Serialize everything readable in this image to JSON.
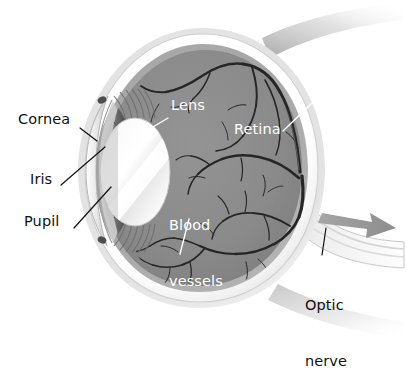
{
  "diagram": {
    "type": "anatomical-cross-section",
    "view": "sagittal cross-section, anterior at left, posterior at right"
  },
  "labels": {
    "cornea": {
      "text": "Cornea",
      "color": "#111111",
      "x": 18,
      "y": 118,
      "leader": {
        "x1": 80,
        "y1": 128,
        "x2": 97,
        "y2": 141,
        "color": "#111111"
      }
    },
    "iris": {
      "text": "Iris",
      "color": "#111111",
      "x": 30,
      "y": 178,
      "leader": {
        "x1": 61,
        "y1": 185,
        "x2": 105,
        "y2": 147,
        "color": "#111111"
      }
    },
    "pupil": {
      "text": "Pupil",
      "color": "#111111",
      "x": 24,
      "y": 220,
      "leader": {
        "x1": 74,
        "y1": 228,
        "x2": 111,
        "y2": 187,
        "color": "#111111"
      }
    },
    "lens": {
      "text": "Lens",
      "color": "#ffffff",
      "x": 171,
      "y": 104,
      "leader": {
        "x1": 168,
        "y1": 118,
        "x2": 148,
        "y2": 130,
        "color": "#ffffff"
      }
    },
    "retina": {
      "text": "Retina",
      "color": "#ffffff",
      "x": 234,
      "y": 128,
      "leader": {
        "x1": 312,
        "y1": 103,
        "x2": 283,
        "y2": 131,
        "color": "#ffffff"
      }
    },
    "blood_vessels": {
      "text": "Blood\nvessels",
      "line1": "Blood",
      "line2": "vessels",
      "color": "#ffffff",
      "x": 169,
      "y": 185,
      "leader": {
        "x1": 189,
        "y1": 219,
        "x2": 180,
        "y2": 254,
        "color": "#ffffff"
      }
    },
    "optic_nerve": {
      "text": "Optic\nnerve",
      "line1": "Optic",
      "line2": "nerve",
      "color": "#111111",
      "x": 305,
      "y": 258,
      "leader": {
        "x1": 326,
        "y1": 228,
        "x2": 322,
        "y2": 255,
        "color": "#111111"
      }
    }
  },
  "structures": [
    {
      "name": "sclera",
      "description": "outer white fibrous coat",
      "color": "#f2f2f2"
    },
    {
      "name": "choroid",
      "description": "middle vascular layer",
      "color": "#b8b8b8"
    },
    {
      "name": "retina",
      "description": "inner light-sensitive layer",
      "color": "#9b9b9b"
    },
    {
      "name": "vitreous-body",
      "description": "gel filling the posterior chamber",
      "color": "#8a8a8a"
    },
    {
      "name": "lens",
      "description": "biconvex focusing element",
      "color": "#f5f5f5"
    },
    {
      "name": "iris",
      "description": "pigmented muscular diaphragm",
      "color": "#6a6a6a"
    },
    {
      "name": "pupil",
      "description": "central aperture",
      "color": "#0d0d0d"
    },
    {
      "name": "cornea",
      "description": "transparent anterior dome",
      "color": "#dcdcdc"
    },
    {
      "name": "ciliary-body",
      "description": "suspensory zonule fibers",
      "color": "#cfcfcf"
    },
    {
      "name": "optic-nerve",
      "description": "nerve bundle exiting posteriorly",
      "color": "#e8e8e8"
    },
    {
      "name": "blood-vessels",
      "description": "dark branching retinal vasculature",
      "color": "#2a2a2a"
    },
    {
      "name": "direction-arrow",
      "description": "gray arrow along optic nerve",
      "color": "#9a9a9a"
    }
  ],
  "palette": {
    "background": "#ffffff",
    "vitreous": "#8a8a8a",
    "sclera_light": "#fbfbfb",
    "sclera_shade": "#cccccc",
    "choroid": "#b0b0b0",
    "vessel": "#262626",
    "lens_body": "#f4f4f4",
    "lens_shadow": "#b9b9b9",
    "iris_dark": "#4a4a4a",
    "pupil": "#0a0a0a",
    "arrow": "#989898",
    "label_dark": "#111111",
    "label_light": "#ffffff"
  }
}
